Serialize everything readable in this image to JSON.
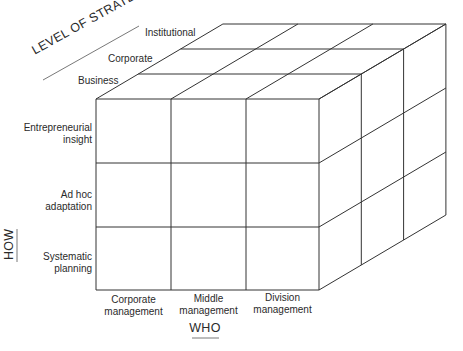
{
  "diagram": {
    "type": "3d-cube-matrix",
    "axes": {
      "level": {
        "title": "LEVEL OF STRATEGY",
        "items": [
          "Business",
          "Corporate",
          "Institutional"
        ]
      },
      "how": {
        "title": "HOW",
        "items": [
          {
            "line1": "Entrepreneurial",
            "line2": "insight"
          },
          {
            "line1": "Ad hoc",
            "line2": "adaptation"
          },
          {
            "line1": "Systematic",
            "line2": "planning"
          }
        ]
      },
      "who": {
        "title": "WHO",
        "items": [
          {
            "line1": "Corporate",
            "line2": "management"
          },
          {
            "line1": "Middle",
            "line2": "management"
          },
          {
            "line1": "Division",
            "line2": "management"
          }
        ]
      }
    },
    "grid": {
      "rows": 3,
      "cols": 3,
      "depth": 3
    },
    "line_color": "#333333"
  }
}
